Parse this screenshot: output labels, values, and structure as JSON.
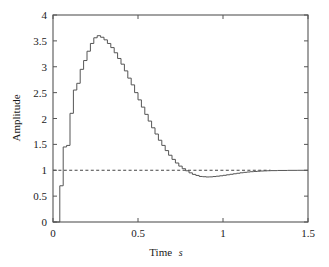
{
  "chart_data": {
    "type": "line",
    "title": "",
    "subtitle": "",
    "xlabel": "Time",
    "xlabel_unit": "s",
    "ylabel": "Amplitude",
    "xlim": [
      0,
      1.5
    ],
    "ylim": [
      0,
      4
    ],
    "xticks": [
      0,
      0.5,
      1,
      1.5
    ],
    "xtick_labels": [
      "0",
      "0.5",
      "1",
      "1.5"
    ],
    "yticks": [
      0,
      0.5,
      1,
      1.5,
      2,
      2.5,
      3,
      3.5,
      4
    ],
    "ytick_labels": [
      "0",
      "0.5",
      "1",
      "1.5",
      "2",
      "2.5",
      "3",
      "3.5",
      "4"
    ],
    "grid": false,
    "legend": "none",
    "frame": "box",
    "tick_direction": "in",
    "series": [
      {
        "name": "step response",
        "style": "staircase",
        "color": "#555555",
        "linewidth": 1,
        "x": [
          0.0,
          0.02,
          0.04,
          0.06,
          0.08,
          0.1,
          0.12,
          0.14,
          0.16,
          0.18,
          0.2,
          0.22,
          0.24,
          0.26,
          0.28,
          0.3,
          0.32,
          0.34,
          0.36,
          0.38,
          0.4,
          0.42,
          0.44,
          0.46,
          0.48,
          0.5,
          0.52,
          0.54,
          0.56,
          0.58,
          0.6,
          0.62,
          0.64,
          0.66,
          0.68,
          0.7,
          0.72,
          0.74,
          0.76,
          0.78,
          0.8,
          0.82,
          0.84,
          0.86,
          0.88,
          0.9,
          0.92,
          0.94,
          0.96,
          0.98,
          1.0,
          1.02,
          1.04,
          1.06,
          1.08,
          1.1,
          1.12,
          1.14,
          1.16,
          1.18,
          1.2,
          1.22,
          1.24,
          1.26,
          1.28,
          1.32,
          1.38,
          1.44,
          1.5
        ],
        "y": [
          0.0,
          0.0,
          0.7,
          1.45,
          1.48,
          2.1,
          2.55,
          2.68,
          2.95,
          3.12,
          3.3,
          3.45,
          3.56,
          3.6,
          3.57,
          3.52,
          3.45,
          3.37,
          3.27,
          3.16,
          3.05,
          2.92,
          2.78,
          2.65,
          2.5,
          2.36,
          2.22,
          2.08,
          1.95,
          1.82,
          1.7,
          1.58,
          1.48,
          1.38,
          1.29,
          1.21,
          1.14,
          1.08,
          1.03,
          0.99,
          0.95,
          0.92,
          0.9,
          0.88,
          0.875,
          0.87,
          0.872,
          0.878,
          0.885,
          0.893,
          0.902,
          0.912,
          0.922,
          0.932,
          0.942,
          0.951,
          0.959,
          0.966,
          0.972,
          0.977,
          0.981,
          0.985,
          0.988,
          0.991,
          0.993,
          0.996,
          0.998,
          0.999,
          1.0
        ]
      },
      {
        "name": "reference level",
        "style": "dashed",
        "color": "#444444",
        "linewidth": 1,
        "value": 1.0,
        "x_start": 0.0,
        "x_end": 1.28
      }
    ],
    "annotations": []
  },
  "figure": {
    "background": "#ffffff",
    "axis_color": "#555555"
  }
}
